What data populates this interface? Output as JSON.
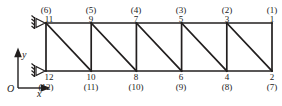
{
  "figure": {
    "name": "plane-truss-node-and-dof-numbering-diagram",
    "stroke_color": "#221f1f",
    "background_color": "#ffffff",
    "geometry": {
      "top_chord_y": 23,
      "bottom_chord_y": 71,
      "left_x": 46,
      "right_x": 272,
      "panel_count": 5,
      "panel_width": 45.2,
      "vertical_x": [
        46,
        91.2,
        136.4,
        181.6,
        226.8,
        272
      ],
      "diagonal_direction": "top-left-to-bottom-right"
    },
    "supports": [
      {
        "name": "support-top-left",
        "type": "pin-roller-triangle",
        "x": 46,
        "y": 23
      },
      {
        "name": "support-bottom-left",
        "type": "pin-roller-triangle",
        "x": 46,
        "y": 71
      }
    ]
  },
  "axes": {
    "origin_label": "O",
    "x_label": "x",
    "y_label": "y",
    "origin_px": {
      "x": 18,
      "y": 88
    },
    "x_arrow_end_px": {
      "x": 48,
      "y": 88
    },
    "y_arrow_end_px": {
      "x": 18,
      "y": 52
    }
  },
  "top_nodes": [
    {
      "node": "11",
      "dof": "(6)",
      "x": 46
    },
    {
      "node": "9",
      "dof": "(5)",
      "x": 91.2
    },
    {
      "node": "7",
      "dof": "(4)",
      "x": 136.4
    },
    {
      "node": "5",
      "dof": "(3)",
      "x": 181.6
    },
    {
      "node": "3",
      "dof": "(2)",
      "x": 226.8
    },
    {
      "node": "1",
      "dof": "(1)",
      "x": 272
    }
  ],
  "bottom_nodes": [
    {
      "node": "12",
      "dof": "(12)",
      "x": 46
    },
    {
      "node": "10",
      "dof": "(11)",
      "x": 91.2
    },
    {
      "node": "8",
      "dof": "(10)",
      "x": 136.4
    },
    {
      "node": "6",
      "dof": "(9)",
      "x": 181.6
    },
    {
      "node": "4",
      "dof": "(8)",
      "x": 226.8
    },
    {
      "node": "2",
      "dof": "(7)",
      "x": 272
    }
  ]
}
